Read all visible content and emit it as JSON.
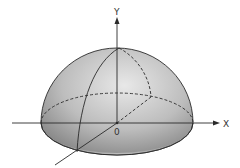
{
  "diagram": {
    "type": "3d-hemisphere-with-axes",
    "labels": {
      "y_axis": "Y",
      "x_axis": "X",
      "origin": "0"
    },
    "colors": {
      "background": "#ffffff",
      "stroke": "#2a2a2a",
      "shade_dark": "#8a8a8a",
      "shade_light": "#e6e6e6"
    }
  }
}
